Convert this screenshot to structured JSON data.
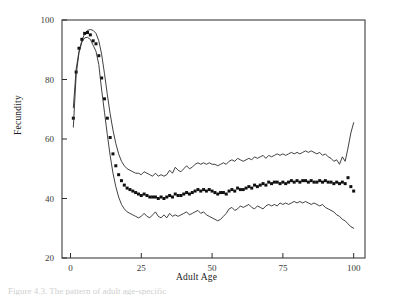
{
  "figure": {
    "caption_fragment": "Figure 4.3.  The pattern of adult age-specific"
  },
  "chart_data": {
    "type": "line",
    "title": "",
    "xlabel": "Adult Age",
    "ylabel": "Fecundity",
    "xlim": [
      -3,
      104
    ],
    "ylim": [
      20,
      100
    ],
    "xticks": [
      0,
      25,
      50,
      75,
      100
    ],
    "yticks": [
      20,
      40,
      60,
      80,
      100
    ],
    "grid": false,
    "legend": "none",
    "frame": "box",
    "tick_direction": "in",
    "series": [
      {
        "name": "Upper confidence limit",
        "style": "line",
        "x": [
          1,
          2,
          3,
          4,
          5,
          6,
          7,
          8,
          9,
          10,
          11,
          12,
          13,
          14,
          15,
          16,
          17,
          18,
          19,
          20,
          21,
          22,
          23,
          24,
          25,
          26,
          27,
          28,
          29,
          30,
          31,
          32,
          33,
          34,
          35,
          36,
          37,
          38,
          39,
          40,
          41,
          42,
          43,
          44,
          45,
          46,
          47,
          48,
          49,
          50,
          51,
          52,
          53,
          54,
          55,
          56,
          57,
          58,
          59,
          60,
          61,
          62,
          63,
          64,
          65,
          66,
          67,
          68,
          69,
          70,
          71,
          72,
          73,
          74,
          75,
          76,
          77,
          78,
          79,
          80,
          81,
          82,
          83,
          84,
          85,
          86,
          87,
          88,
          89,
          90,
          91,
          92,
          93,
          94,
          95,
          96,
          97,
          98,
          99,
          100
        ],
        "y": [
          70.5,
          83.5,
          89.5,
          93.0,
          95.5,
          96.5,
          96.8,
          96.5,
          95.5,
          93.0,
          88.5,
          82.0,
          75.0,
          68.5,
          63.0,
          58.5,
          55.0,
          52.5,
          51.0,
          50.0,
          49.5,
          49.0,
          48.5,
          48.5,
          48.0,
          49.0,
          48.5,
          48.0,
          47.5,
          48.5,
          47.5,
          48.0,
          47.5,
          48.0,
          49.5,
          48.5,
          50.5,
          49.5,
          49.0,
          50.0,
          51.0,
          50.0,
          50.5,
          51.5,
          52.0,
          51.5,
          52.0,
          51.5,
          52.0,
          51.5,
          51.5,
          51.0,
          51.5,
          52.0,
          51.5,
          52.5,
          53.0,
          52.5,
          53.5,
          53.0,
          52.5,
          53.0,
          53.5,
          53.0,
          54.0,
          53.5,
          54.0,
          54.5,
          53.5,
          54.5,
          54.0,
          54.5,
          55.0,
          54.5,
          55.0,
          54.5,
          55.0,
          55.5,
          55.0,
          55.5,
          55.0,
          55.5,
          56.0,
          55.5,
          56.0,
          55.5,
          55.0,
          55.5,
          54.5,
          55.0,
          54.0,
          53.5,
          52.5,
          53.0,
          51.5,
          54.0,
          52.5,
          57.0,
          62.0,
          65.5
        ]
      },
      {
        "name": "Fecundity (observed)",
        "style": "markers",
        "marker": "filled-square",
        "x": [
          1,
          2,
          3,
          4,
          5,
          6,
          7,
          8,
          9,
          10,
          11,
          12,
          13,
          14,
          15,
          16,
          17,
          18,
          19,
          20,
          21,
          22,
          23,
          24,
          25,
          26,
          27,
          28,
          29,
          30,
          31,
          32,
          33,
          34,
          35,
          36,
          37,
          38,
          39,
          40,
          41,
          42,
          43,
          44,
          45,
          46,
          47,
          48,
          49,
          50,
          51,
          52,
          53,
          54,
          55,
          56,
          57,
          58,
          59,
          60,
          61,
          62,
          63,
          64,
          65,
          66,
          67,
          68,
          69,
          70,
          71,
          72,
          73,
          74,
          75,
          76,
          77,
          78,
          79,
          80,
          81,
          82,
          83,
          84,
          85,
          86,
          87,
          88,
          89,
          90,
          91,
          92,
          93,
          94,
          95,
          96,
          97,
          98,
          99,
          100
        ],
        "y": [
          67.0,
          82.5,
          90.5,
          93.5,
          95.5,
          95.8,
          95.0,
          93.0,
          92.0,
          88.0,
          80.5,
          73.5,
          67.0,
          60.5,
          55.0,
          51.0,
          48.0,
          46.0,
          44.5,
          43.5,
          43.0,
          42.5,
          42.0,
          41.5,
          41.0,
          41.5,
          41.0,
          40.5,
          40.5,
          40.5,
          40.0,
          40.5,
          40.0,
          40.5,
          41.0,
          40.5,
          41.5,
          41.0,
          41.0,
          41.5,
          42.0,
          41.5,
          42.0,
          42.5,
          43.0,
          42.5,
          43.0,
          42.5,
          43.0,
          42.5,
          42.0,
          41.5,
          42.0,
          42.0,
          41.5,
          42.5,
          43.0,
          42.5,
          43.5,
          43.0,
          43.0,
          43.5,
          44.0,
          43.5,
          44.5,
          44.0,
          44.5,
          45.0,
          44.5,
          45.5,
          45.0,
          45.5,
          45.5,
          45.0,
          45.5,
          45.0,
          45.5,
          46.0,
          45.5,
          46.0,
          45.5,
          46.0,
          46.0,
          45.5,
          46.0,
          45.5,
          45.5,
          46.0,
          45.5,
          46.0,
          45.5,
          45.5,
          45.0,
          45.5,
          45.0,
          45.5,
          45.0,
          47.0,
          44.0,
          42.5
        ]
      },
      {
        "name": "Lower confidence limit",
        "style": "line",
        "x": [
          1,
          2,
          3,
          4,
          5,
          6,
          7,
          8,
          9,
          10,
          11,
          12,
          13,
          14,
          15,
          16,
          17,
          18,
          19,
          20,
          21,
          22,
          23,
          24,
          25,
          26,
          27,
          28,
          29,
          30,
          31,
          32,
          33,
          34,
          35,
          36,
          37,
          38,
          39,
          40,
          41,
          42,
          43,
          44,
          45,
          46,
          47,
          48,
          49,
          50,
          51,
          52,
          53,
          54,
          55,
          56,
          57,
          58,
          59,
          60,
          61,
          62,
          63,
          64,
          65,
          66,
          67,
          68,
          69,
          70,
          71,
          72,
          73,
          74,
          75,
          76,
          77,
          78,
          79,
          80,
          81,
          82,
          83,
          84,
          85,
          86,
          87,
          88,
          89,
          90,
          91,
          92,
          93,
          94,
          95,
          96,
          97,
          98,
          99,
          100
        ],
        "y": [
          64.0,
          81.5,
          89.0,
          92.5,
          94.0,
          94.2,
          93.5,
          91.5,
          89.5,
          85.0,
          76.5,
          69.0,
          61.5,
          54.5,
          48.5,
          44.0,
          40.5,
          38.0,
          36.5,
          35.5,
          35.0,
          34.5,
          34.0,
          33.5,
          34.0,
          35.0,
          34.0,
          33.5,
          34.5,
          35.5,
          34.0,
          33.5,
          34.5,
          33.5,
          35.0,
          34.0,
          34.5,
          34.0,
          34.5,
          35.0,
          35.5,
          34.5,
          35.0,
          35.5,
          36.0,
          35.0,
          35.5,
          34.5,
          34.0,
          33.5,
          33.0,
          32.5,
          33.0,
          34.0,
          35.0,
          36.5,
          37.0,
          36.0,
          36.5,
          37.5,
          37.0,
          37.5,
          38.0,
          37.0,
          36.5,
          37.5,
          37.0,
          36.5,
          37.5,
          38.0,
          37.5,
          38.0,
          37.5,
          38.5,
          38.0,
          38.5,
          38.0,
          38.5,
          39.0,
          38.5,
          39.0,
          38.5,
          39.0,
          38.5,
          38.0,
          38.5,
          38.0,
          37.5,
          38.0,
          37.0,
          36.5,
          36.0,
          35.5,
          34.5,
          34.0,
          33.0,
          32.5,
          31.5,
          30.5,
          30.0
        ]
      }
    ]
  }
}
